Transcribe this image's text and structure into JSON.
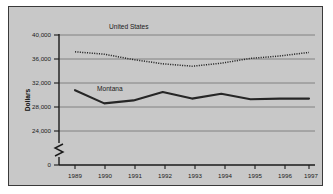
{
  "figure": {
    "background_color": "#c8c8c8",
    "border_color": "#3a3a3a",
    "page_background": "#ffffff"
  },
  "axes": {
    "ylabel": "Dollars",
    "y_ticks": [
      "0",
      "24,000",
      "28,000",
      "32,000",
      "36,000",
      "40,000"
    ],
    "x_ticks": [
      "1989",
      "1990",
      "1991",
      "1992",
      "1993",
      "1994",
      "1995",
      "1996",
      "1997"
    ],
    "axis_break": "axis-break-symbol"
  },
  "series_labels": {
    "united_states": "United States",
    "montana": "Montana"
  },
  "chart_data": {
    "type": "line",
    "title": "",
    "xlabel": "",
    "ylabel": "Dollars",
    "x": [
      1989,
      1990,
      1991,
      1992,
      1993,
      1994,
      1995,
      1996,
      1997
    ],
    "categories": [
      "1989",
      "1990",
      "1991",
      "1992",
      "1993",
      "1994",
      "1995",
      "1996",
      "1997"
    ],
    "ylim": [
      24000,
      40000
    ],
    "y_ticks": [
      24000,
      28000,
      32000,
      36000,
      40000
    ],
    "y_axis_broken_below": 24000,
    "grid": true,
    "legend": "inline-labels",
    "series": [
      {
        "name": "United States",
        "style": "dotted",
        "color": "#262626",
        "values": [
          37200,
          36800,
          35900,
          35200,
          34800,
          35300,
          36100,
          36500,
          37100
        ]
      },
      {
        "name": "Montana",
        "style": "solid",
        "color": "#262626",
        "values": [
          30800,
          28600,
          29100,
          30500,
          29400,
          30200,
          29300,
          29400,
          29400
        ]
      }
    ]
  }
}
